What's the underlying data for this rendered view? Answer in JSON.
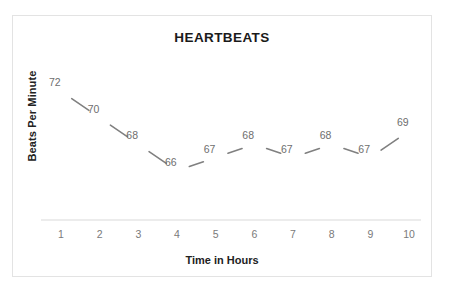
{
  "chart_data": {
    "type": "line",
    "title": "HEARTBEATS",
    "xlabel": "Time in Hours",
    "ylabel": "Beats Per Minute",
    "categories": [
      "1",
      "2",
      "3",
      "4",
      "5",
      "6",
      "7",
      "8",
      "9",
      "10"
    ],
    "x": [
      1,
      2,
      3,
      4,
      5,
      6,
      7,
      8,
      9,
      10
    ],
    "values": [
      72,
      70,
      68,
      66,
      67,
      68,
      67,
      68,
      67,
      69
    ],
    "point_labels": [
      "72",
      "70",
      "68",
      "66",
      "67",
      "68",
      "67",
      "68",
      "67",
      "69"
    ],
    "series": [
      {
        "name": "Beats Per Minute",
        "values": [
          72,
          70,
          68,
          66,
          67,
          68,
          67,
          68,
          67,
          69
        ]
      }
    ],
    "ylim": [
      65,
      73
    ],
    "xlim": [
      1,
      10
    ],
    "grid": false,
    "legend": false,
    "legend_position": "none",
    "show_markers": false,
    "show_data_labels": true,
    "line_color": "#808080",
    "label_color": "#6e6e6e",
    "axis_line_color": "#d9d9d9",
    "title_color": "#1a1a1a",
    "frame_color": "#e3e3e3",
    "background_color": "#ffffff"
  },
  "axes": {
    "x_tick_labels": [
      "1",
      "2",
      "3",
      "4",
      "5",
      "6",
      "7",
      "8",
      "9",
      "10"
    ],
    "y_tick_labels": []
  }
}
